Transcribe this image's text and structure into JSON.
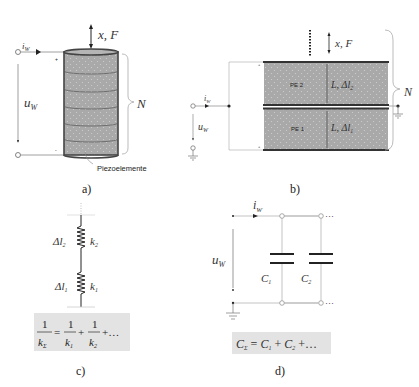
{
  "panels": {
    "a": {
      "caption": "a)",
      "current_label": "i",
      "current_sub": "W",
      "voltage_label": "u",
      "voltage_sub": "W",
      "force_label": "x, F",
      "count_label": "N",
      "element_label": "Piezoelemente",
      "plus": "+",
      "minus": "-",
      "layers": 6
    },
    "b": {
      "caption": "b)",
      "current_label": "i",
      "current_sub": "W",
      "voltage_label": "u",
      "voltage_sub": "W",
      "force_label": "x, F",
      "count_label": "N",
      "elements": [
        {
          "name": "PE 2",
          "dim": "L, Δl",
          "sub": "2"
        },
        {
          "name": "PE 1",
          "dim": "L, Δl",
          "sub": "1"
        }
      ]
    },
    "c": {
      "caption": "c)",
      "springs": [
        {
          "disp": "Δl",
          "disp_sub": "2",
          "k": "k",
          "k_sub": "2"
        },
        {
          "disp": "Δl",
          "disp_sub": "1",
          "k": "k",
          "k_sub": "1"
        }
      ],
      "formula": "1/kΣ = 1/k1 + 1/k2 + ..."
    },
    "d": {
      "caption": "d)",
      "current_label": "i",
      "current_sub": "W",
      "voltage_label": "u",
      "voltage_sub": "W",
      "capacitors": [
        {
          "label": "C",
          "sub": "1"
        },
        {
          "label": "C",
          "sub": "2"
        }
      ],
      "ellipsis": "···",
      "formula": "CΣ = C1 + C2 + ..."
    }
  },
  "colors": {
    "element_fill": "#a9a9a9",
    "element_stroke": "#444444",
    "wire": "#888888",
    "formula_bg": "#e3e3e3"
  }
}
